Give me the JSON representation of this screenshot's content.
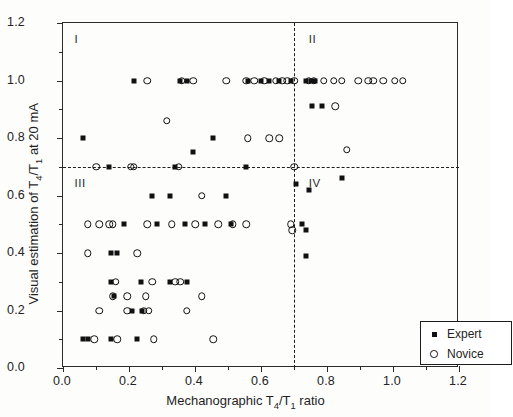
{
  "chart_data": {
    "type": "scatter",
    "title": "",
    "xlabel": "Mechanographic T4/T1 ratio",
    "ylabel": "Visual estimation of T4/T1 at 20 mA",
    "xlabel_parts": {
      "pre": "Mechanographic T",
      "sub1": "4",
      "mid": "/T",
      "sub2": "1",
      "post": " ratio"
    },
    "ylabel_parts": {
      "pre": "Visual estimation of T",
      "sub1": "4",
      "mid": "/T",
      "sub2": "1",
      "post": " at 20 mA"
    },
    "xlim": [
      0.0,
      1.2
    ],
    "ylim": [
      0.0,
      1.2
    ],
    "grid": false,
    "xticks": [
      0.0,
      0.2,
      0.4,
      0.6,
      0.8,
      1.0,
      1.2
    ],
    "yticks": [
      0.0,
      0.2,
      0.4,
      0.6,
      0.8,
      1.0,
      1.2
    ],
    "xtick_labels": [
      "0.0",
      "0.2",
      "0.4",
      "0.6",
      "0.8",
      "1.0",
      "1.2"
    ],
    "ytick_labels": [
      "0.0",
      "0.2",
      "0.4",
      "0.6",
      "0.8",
      "1.0",
      "1.2"
    ],
    "xminor_ticks": [
      0.1,
      0.3,
      0.5,
      0.7,
      0.9,
      1.1
    ],
    "yminor_ticks": [
      0.1,
      0.3,
      0.5,
      0.7,
      0.9,
      1.1
    ],
    "reference_lines": [
      {
        "name": "horizontal-threshold",
        "orientation": "horizontal",
        "value": 0.7,
        "style": "dashed"
      },
      {
        "name": "vertical-threshold",
        "orientation": "vertical",
        "value": 0.7,
        "style": "dashed"
      }
    ],
    "quadrant_labels": [
      {
        "label": "I",
        "x": 0.035,
        "y": 1.145
      },
      {
        "label": "II",
        "x": 0.745,
        "y": 1.145
      },
      {
        "label": "III",
        "x": 0.035,
        "y": 0.645
      },
      {
        "label": "IV",
        "x": 0.745,
        "y": 0.645
      }
    ],
    "legend": {
      "position": "bottom-right",
      "entries": [
        {
          "name": "Expert",
          "marker": "filled-square"
        },
        {
          "name": "Novice",
          "marker": "open-circle"
        }
      ]
    },
    "series": [
      {
        "name": "Expert",
        "marker": "filled-square",
        "color": "#111111",
        "points": [
          [
            0.215,
            1.0
          ],
          [
            0.355,
            1.0
          ],
          [
            0.375,
            1.0
          ],
          [
            0.625,
            1.0
          ],
          [
            0.655,
            1.0
          ],
          [
            0.69,
            1.0
          ],
          [
            0.735,
            1.0
          ],
          [
            0.75,
            1.0
          ],
          [
            0.765,
            1.0
          ],
          [
            0.56,
            1.0
          ],
          [
            0.6,
            1.0
          ],
          [
            0.755,
            0.91
          ],
          [
            0.785,
            0.91
          ],
          [
            0.06,
            0.8
          ],
          [
            0.455,
            0.8
          ],
          [
            0.395,
            0.75
          ],
          [
            0.845,
            0.66
          ],
          [
            0.705,
            0.64
          ],
          [
            0.14,
            0.7
          ],
          [
            0.34,
            0.7
          ],
          [
            0.555,
            0.7
          ],
          [
            0.27,
            0.6
          ],
          [
            0.325,
            0.6
          ],
          [
            0.495,
            0.6
          ],
          [
            0.745,
            0.62
          ],
          [
            0.185,
            0.5
          ],
          [
            0.285,
            0.5
          ],
          [
            0.37,
            0.5
          ],
          [
            0.43,
            0.5
          ],
          [
            0.51,
            0.5
          ],
          [
            0.725,
            0.5
          ],
          [
            0.145,
            0.4
          ],
          [
            0.165,
            0.4
          ],
          [
            0.145,
            0.3
          ],
          [
            0.235,
            0.3
          ],
          [
            0.325,
            0.3
          ],
          [
            0.375,
            0.3
          ],
          [
            0.155,
            0.25
          ],
          [
            0.21,
            0.2
          ],
          [
            0.24,
            0.2
          ],
          [
            0.06,
            0.1
          ],
          [
            0.075,
            0.1
          ],
          [
            0.145,
            0.1
          ],
          [
            0.225,
            0.1
          ],
          [
            0.735,
            0.48
          ],
          [
            0.735,
            0.39
          ]
        ]
      },
      {
        "name": "Novice",
        "marker": "open-circle",
        "color": "#111111",
        "points": [
          [
            0.255,
            1.0
          ],
          [
            0.36,
            1.0
          ],
          [
            0.395,
            1.0
          ],
          [
            0.495,
            1.0
          ],
          [
            0.555,
            1.0
          ],
          [
            0.58,
            1.0
          ],
          [
            0.61,
            1.0
          ],
          [
            0.645,
            1.0
          ],
          [
            0.665,
            1.0
          ],
          [
            0.68,
            1.0
          ],
          [
            0.7,
            1.0
          ],
          [
            0.745,
            1.0
          ],
          [
            0.76,
            1.0
          ],
          [
            0.79,
            1.0
          ],
          [
            0.82,
            1.0
          ],
          [
            0.845,
            1.0
          ],
          [
            0.895,
            1.0
          ],
          [
            0.925,
            1.0
          ],
          [
            0.94,
            1.0
          ],
          [
            0.97,
            1.0
          ],
          [
            1.005,
            1.0
          ],
          [
            1.03,
            1.0
          ],
          [
            0.825,
            0.91
          ],
          [
            0.315,
            0.86
          ],
          [
            0.56,
            0.8
          ],
          [
            0.625,
            0.8
          ],
          [
            0.655,
            0.8
          ],
          [
            0.86,
            0.76
          ],
          [
            0.1,
            0.7
          ],
          [
            0.205,
            0.7
          ],
          [
            0.215,
            0.7
          ],
          [
            0.35,
            0.7
          ],
          [
            0.7,
            0.7
          ],
          [
            0.42,
            0.6
          ],
          [
            0.075,
            0.5
          ],
          [
            0.11,
            0.5
          ],
          [
            0.14,
            0.5
          ],
          [
            0.15,
            0.5
          ],
          [
            0.255,
            0.5
          ],
          [
            0.33,
            0.5
          ],
          [
            0.4,
            0.5
          ],
          [
            0.47,
            0.5
          ],
          [
            0.515,
            0.5
          ],
          [
            0.555,
            0.5
          ],
          [
            0.69,
            0.5
          ],
          [
            0.075,
            0.4
          ],
          [
            0.225,
            0.4
          ],
          [
            0.16,
            0.3
          ],
          [
            0.27,
            0.3
          ],
          [
            0.34,
            0.3
          ],
          [
            0.355,
            0.3
          ],
          [
            0.15,
            0.25
          ],
          [
            0.195,
            0.25
          ],
          [
            0.25,
            0.25
          ],
          [
            0.42,
            0.25
          ],
          [
            0.11,
            0.2
          ],
          [
            0.195,
            0.2
          ],
          [
            0.245,
            0.2
          ],
          [
            0.26,
            0.2
          ],
          [
            0.375,
            0.2
          ],
          [
            0.095,
            0.1
          ],
          [
            0.165,
            0.1
          ],
          [
            0.275,
            0.1
          ],
          [
            0.455,
            0.1
          ],
          [
            0.695,
            0.48
          ]
        ]
      }
    ]
  }
}
